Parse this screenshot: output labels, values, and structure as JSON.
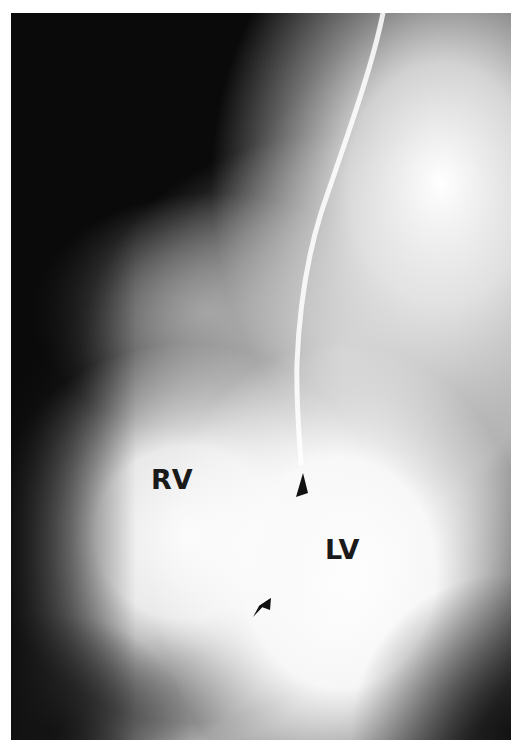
{
  "image": {
    "description": "Cardiac angiogram with catheter, labeled ventricles",
    "labels": [
      {
        "text": "RV",
        "meaning": "right ventricle"
      },
      {
        "text": "LV",
        "meaning": "left ventricle"
      }
    ],
    "annotations": [
      {
        "type": "arrowhead",
        "position": "upper, near catheter tip"
      },
      {
        "type": "arrowhead",
        "position": "lower, between ventricles"
      }
    ],
    "colors": {
      "background": "#ffffff",
      "dark": "#0d0d0d",
      "bright": "#ffffff",
      "label": "#1a1a1a"
    }
  }
}
